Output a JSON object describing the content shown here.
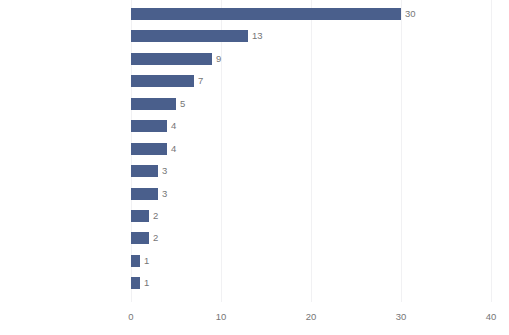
{
  "chart_data": {
    "type": "bar",
    "orientation": "horizontal",
    "title": "",
    "subtitle": "",
    "xlabel": "",
    "ylabel": "",
    "xlim": [
      0,
      40
    ],
    "xticks": [
      "0",
      "10",
      "20",
      "30",
      "40"
    ],
    "grid": true,
    "legend": null,
    "bar_color": "#4a5f8c",
    "background_color": "#ffffff",
    "label_color": "#757575",
    "gridline_color": "#f1f1f3",
    "categories": [
      "NSAIDs, oral",
      "Muscle relaxants",
      "Anticonvulsants",
      "Antidepressants",
      "Acetaminophen",
      "Opioids",
      "NSAIDs, topical",
      "Sedatives",
      "Non-NSAIDs, topical",
      "NSAIDs, injection",
      "Cannabinoids",
      "Corticosteroid, oral",
      "Dietary supplements, oral"
    ],
    "values": [
      30,
      13,
      9,
      7,
      5,
      4,
      4,
      3,
      3,
      2,
      2,
      1,
      1
    ],
    "value_labels": [
      "30",
      "13",
      "9",
      "7",
      "5",
      "4",
      "4",
      "3",
      "3",
      "2",
      "2",
      "1",
      "1"
    ]
  }
}
